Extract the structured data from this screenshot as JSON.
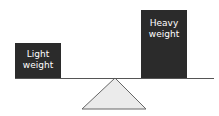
{
  "diagram": {
    "left_box": {
      "line1": "Light",
      "line2": "weight"
    },
    "right_box": {
      "line1": "Heavy",
      "line2": "weight"
    },
    "colors": {
      "box": "#2b2b2b",
      "fulcrum": "#ebebeb",
      "line": "#555555"
    }
  }
}
